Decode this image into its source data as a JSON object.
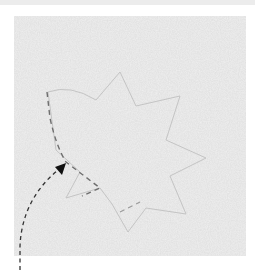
{
  "figure": {
    "colors": {
      "background": "#ffffff",
      "top_strip": "#ececec",
      "panel": "#e3e3e3",
      "outline": "#bdbdbd",
      "trace": "#6e6e6e",
      "arrow": "#1a1a1a"
    },
    "elements": {
      "panel": "textured-panel",
      "shape": "leaf-outline",
      "trace": "dashed-trace-path",
      "arrow": "dashed-curved-arrow"
    }
  }
}
